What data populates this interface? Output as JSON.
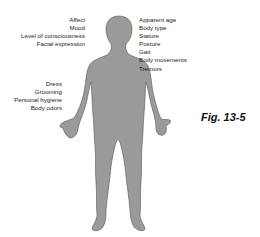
{
  "diagram": {
    "body_color": "#9a9a9a",
    "outline_color": "#555555",
    "labels_head_left": [
      "Affect",
      "Mood",
      "Level of consciousness",
      "Facial expression"
    ],
    "labels_right": [
      "Apparent age",
      "Body type",
      "Stature",
      "Posture",
      "Gait",
      "Body movements",
      "Tremors"
    ],
    "labels_lower_left": [
      "Dress",
      "Grooming",
      "Personal hygiene",
      "Body odors"
    ],
    "caption": "Fig. 13-5"
  }
}
